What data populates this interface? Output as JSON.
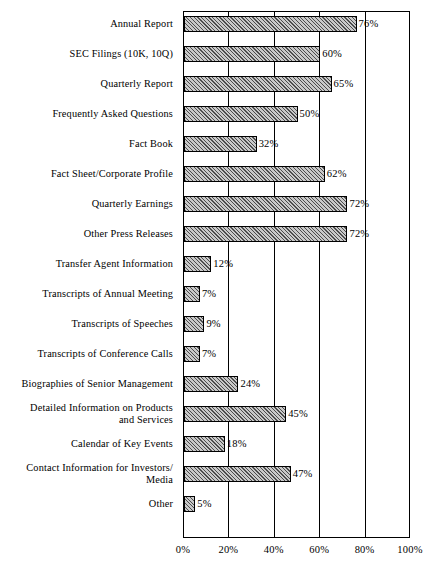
{
  "chart_data": {
    "type": "bar",
    "orientation": "horizontal",
    "title": "",
    "xlabel": "",
    "ylabel": "",
    "xlim": [
      0,
      100
    ],
    "xticks": [
      0,
      20,
      40,
      60,
      80,
      100
    ],
    "xtick_labels": [
      "0%",
      "20%",
      "40%",
      "60%",
      "80%",
      "100%"
    ],
    "grid": true,
    "grid_axis": "x",
    "legend": false,
    "value_label_suffix": "%",
    "bar_fill": "diagonal-hatch",
    "bar_fill_color": "#c9c9c9",
    "bar_edge_color": "#000000",
    "categories": [
      "Annual Report",
      "SEC Filings (10K, 10Q)",
      "Quarterly Report",
      "Frequently Asked Questions",
      "Fact Book",
      "Fact Sheet/Corporate Profile",
      "Quarterly Earnings",
      "Other Press Releases",
      "Transfer Agent Information",
      "Transcripts of Annual Meeting",
      "Transcripts of Speeches",
      "Transcripts of Conference Calls",
      "Biographies of Senior Management",
      "Detailed Information on Products and Services",
      "Calendar of Key Events",
      "Contact Information for Investors/ Media",
      "Other"
    ],
    "values": [
      76,
      60,
      65,
      50,
      32,
      62,
      72,
      72,
      12,
      7,
      9,
      7,
      24,
      45,
      18,
      47,
      5
    ]
  },
  "rows": [
    {
      "label_lines": [
        "Annual Report"
      ],
      "value": 76,
      "value_label": "76%"
    },
    {
      "label_lines": [
        "SEC Filings (10K, 10Q)"
      ],
      "value": 60,
      "value_label": "60%"
    },
    {
      "label_lines": [
        "Quarterly Report"
      ],
      "value": 65,
      "value_label": "65%"
    },
    {
      "label_lines": [
        "Frequently Asked Questions"
      ],
      "value": 50,
      "value_label": "50%"
    },
    {
      "label_lines": [
        "Fact Book"
      ],
      "value": 32,
      "value_label": "32%"
    },
    {
      "label_lines": [
        "Fact Sheet/Corporate Profile"
      ],
      "value": 62,
      "value_label": "62%"
    },
    {
      "label_lines": [
        "Quarterly Earnings"
      ],
      "value": 72,
      "value_label": "72%"
    },
    {
      "label_lines": [
        "Other Press Releases"
      ],
      "value": 72,
      "value_label": "72%"
    },
    {
      "label_lines": [
        "Transfer Agent Information"
      ],
      "value": 12,
      "value_label": "12%"
    },
    {
      "label_lines": [
        "Transcripts of Annual Meeting"
      ],
      "value": 7,
      "value_label": "7%"
    },
    {
      "label_lines": [
        "Transcripts of Speeches"
      ],
      "value": 9,
      "value_label": "9%"
    },
    {
      "label_lines": [
        "Transcripts of Conference Calls"
      ],
      "value": 7,
      "value_label": "7%"
    },
    {
      "label_lines": [
        "Biographies of Senior Management"
      ],
      "value": 24,
      "value_label": "24%"
    },
    {
      "label_lines": [
        "Detailed Information on Products",
        "and Services"
      ],
      "value": 45,
      "value_label": "45%"
    },
    {
      "label_lines": [
        "Calendar of Key Events"
      ],
      "value": 18,
      "value_label": "18%"
    },
    {
      "label_lines": [
        "Contact Information for Investors/",
        "Media"
      ],
      "value": 47,
      "value_label": "47%"
    },
    {
      "label_lines": [
        "Other"
      ],
      "value": 5,
      "value_label": "5%"
    }
  ],
  "axis": {
    "tick_labels": [
      "0%",
      "20%",
      "40%",
      "60%",
      "80%",
      "100%"
    ],
    "tick_values": [
      0,
      20,
      40,
      60,
      80,
      100
    ]
  },
  "colors": {
    "axis": "#000000",
    "grid": "#000000",
    "bar_fill": "#c9c9c9",
    "background": "#ffffff"
  }
}
